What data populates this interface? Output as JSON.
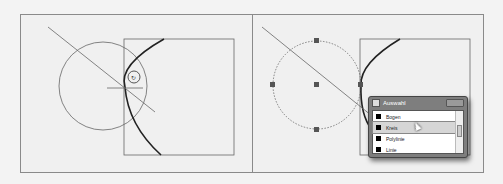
{
  "figure": {
    "left_panel": {
      "label": "Before: circle drawn tangent, cursor at tangent point"
    },
    "right_panel": {
      "label": "After: circle selected with grips, selection popup shown"
    }
  },
  "popup": {
    "title": "Auswahl",
    "items": [
      {
        "label": "Bogen",
        "selected": false
      },
      {
        "label": "Kreis",
        "selected": true
      },
      {
        "label": "Polylinie",
        "selected": false
      },
      {
        "label": "Linie",
        "selected": false
      }
    ]
  },
  "colors": {
    "background": "#f0f0f0",
    "frame": "#8a8a8a",
    "geometry": "#555555",
    "arc": "#222222",
    "grip": "#555555",
    "popup_frame": "#7e7e7e"
  }
}
